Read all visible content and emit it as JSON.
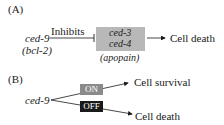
{
  "panel_a": {
    "label": "(A)",
    "source_gene": "ced-9",
    "source_alias": "(bcl-2)",
    "edge_label": "Inhibits",
    "target_genes": [
      "ced-3",
      "ced-4"
    ],
    "target_alias": "(apopain)",
    "outcome": "Cell death"
  },
  "panel_b": {
    "label": "(B)",
    "source_gene": "ced-9",
    "switch_on": "ON",
    "switch_off": "OFF",
    "outcome_on": "Cell survival",
    "outcome_off": "Cell death"
  },
  "colors": {
    "box_fill": "#b8b8b8",
    "on_fill": "#8a8a8a",
    "off_fill": "#1a1a1a",
    "line": "#1a1a1a"
  }
}
